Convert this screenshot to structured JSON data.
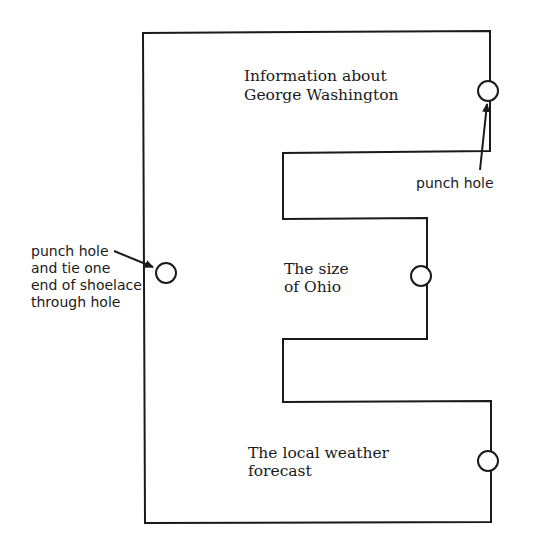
{
  "diagram": {
    "shape": "letter-E cutout",
    "colors": {
      "stroke": "#1a1a1a",
      "fill": "#ffffff",
      "text": "#1a1a1a"
    },
    "outline_points": [
      [
        143,
        33
      ],
      [
        490,
        31
      ],
      [
        490,
        151
      ],
      [
        283,
        153
      ],
      [
        283,
        219
      ],
      [
        427,
        218
      ],
      [
        427,
        339
      ],
      [
        283,
        339
      ],
      [
        283,
        402
      ],
      [
        491,
        401
      ],
      [
        491,
        522
      ],
      [
        145,
        523
      ]
    ],
    "sections": [
      {
        "id": "top",
        "lines": [
          "Information about",
          "George Washington"
        ]
      },
      {
        "id": "middle",
        "lines": [
          "The size",
          "of Ohio"
        ]
      },
      {
        "id": "bottom",
        "lines": [
          "The local weather",
          "forecast"
        ]
      }
    ],
    "holes": [
      {
        "id": "top-right",
        "cx": 488,
        "cy": 91,
        "r": 10
      },
      {
        "id": "left-spine",
        "cx": 166,
        "cy": 273,
        "r": 10
      },
      {
        "id": "middle-right",
        "cx": 421,
        "cy": 276,
        "r": 10
      },
      {
        "id": "bottom-right",
        "cx": 488,
        "cy": 461,
        "r": 10
      }
    ],
    "annotations": [
      {
        "id": "top-right-note",
        "lines": [
          "punch hole"
        ]
      },
      {
        "id": "left-note",
        "lines": [
          "punch hole",
          "and tie one",
          "end of shoelace",
          "through hole"
        ]
      }
    ]
  }
}
